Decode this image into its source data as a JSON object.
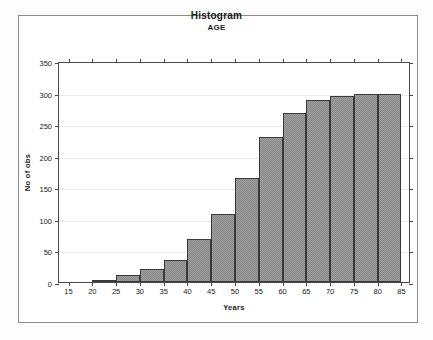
{
  "chart_data": {
    "type": "bar",
    "title": "Histogram",
    "subtitle": "AGE",
    "xlabel": "Years",
    "ylabel": "No of obs",
    "xlim": [
      13,
      87
    ],
    "ylim": [
      0,
      350
    ],
    "grid": true,
    "legend": null,
    "bin_width": 5,
    "bin_starts": [
      20,
      25,
      30,
      35,
      40,
      45,
      50,
      55,
      60,
      65,
      70,
      75,
      80
    ],
    "categories": [
      "20-25",
      "25-30",
      "30-35",
      "35-40",
      "40-45",
      "45-50",
      "50-55",
      "55-60",
      "60-65",
      "65-70",
      "70-75",
      "75-80",
      "80-85"
    ],
    "values": [
      3,
      11,
      21,
      35,
      68,
      108,
      165,
      230,
      268,
      288,
      294,
      298,
      298
    ],
    "x_ticks": [
      15,
      20,
      25,
      30,
      35,
      40,
      45,
      50,
      55,
      60,
      65,
      70,
      75,
      80,
      85
    ],
    "y_ticks": [
      0,
      50,
      100,
      150,
      200,
      250,
      300,
      350
    ],
    "bar_fill_color": "#9d9d9d",
    "bar_border_color": "#3a3a3a",
    "axis_color": "#4a4a4a",
    "grid_color": "#eeeaea",
    "frame_color": "#8d8d8d",
    "background_color": "#ffffff"
  }
}
